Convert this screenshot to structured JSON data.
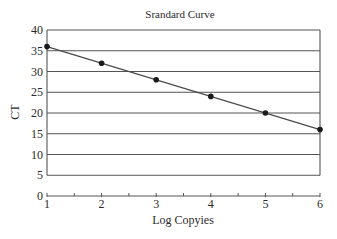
{
  "chart_data": {
    "type": "scatter",
    "title": "Srandard Curve",
    "xlabel": "Log Copyies",
    "ylabel": "CT",
    "x": [
      1,
      2,
      3,
      4,
      5,
      6
    ],
    "series": [
      {
        "name": "Standard",
        "values": [
          36,
          32,
          28,
          24,
          20,
          16
        ],
        "marker": "circle",
        "trendline": {
          "type": "linear",
          "x0": 1,
          "y0": 36,
          "x1": 6,
          "y1": 16
        }
      }
    ],
    "xlim": [
      1,
      6
    ],
    "ylim": [
      0,
      40
    ],
    "xticks": [
      1,
      2,
      3,
      4,
      5,
      6
    ],
    "xminor_ticks": [
      1.5,
      2.5,
      3.5,
      4.5,
      5.5
    ],
    "yticks": [
      0,
      5,
      10,
      15,
      20,
      25,
      30,
      35,
      40
    ],
    "grid": {
      "horizontal": true,
      "vertical": false
    },
    "legend": null
  },
  "labels": {
    "title": "Srandard Curve",
    "xlabel": "Log Copyies",
    "ylabel": "CT",
    "yticks": [
      "0",
      "5",
      "10",
      "15",
      "20",
      "25",
      "30",
      "35",
      "40"
    ],
    "xticks": [
      "1",
      "2",
      "3",
      "4",
      "5",
      "6"
    ]
  },
  "colors": {
    "line": "#4a4a4a",
    "grid": "#555555",
    "marker": "#1a1a1a",
    "text": "#2a2a2a"
  }
}
